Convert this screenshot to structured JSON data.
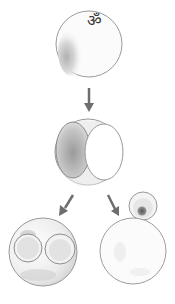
{
  "diagram": {
    "top_cell": {
      "symbol": "ॐ",
      "symbol_name": "om-symbol"
    },
    "colors": {
      "outline": "#8a8a8a",
      "shade": "#9a9a9a",
      "arrow": "#6e6e6e",
      "background": "#ffffff"
    },
    "stages": [
      {
        "name": "original-cell"
      },
      {
        "name": "dividing-cell"
      },
      {
        "name": "cell-with-two-nuclei"
      },
      {
        "name": "separated-cells"
      }
    ]
  }
}
